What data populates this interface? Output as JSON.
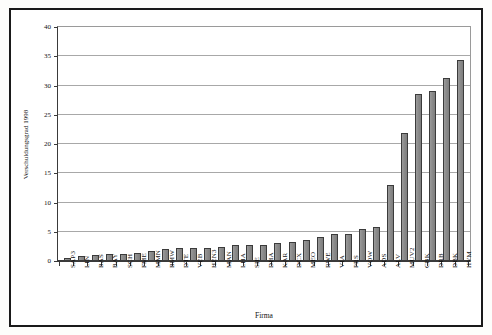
{
  "chart_data": {
    "type": "bar",
    "title": "",
    "xlabel": "Firma",
    "ylabel": "Verschuldungsgrad 1998",
    "ylim": [
      0,
      40
    ],
    "ytick_step": 5,
    "yticks": [
      0,
      5,
      10,
      15,
      20,
      25,
      30,
      35,
      40
    ],
    "grid": true,
    "legend": false,
    "bar_color": "#8a8a8a",
    "bar_border_color": "#3b3b3b",
    "categories": [
      "SAP3",
      "LIN",
      "BAS",
      "BAY",
      "SCH",
      "FME",
      "MMN",
      "BMW",
      "DTE",
      "VEB",
      "HEN3",
      "MAN",
      "LHA",
      "SIE",
      "DHA",
      "KAR",
      "DCX",
      "MEO",
      "RWE",
      "VIA",
      "PRS",
      "VOW",
      "ADS",
      "ALV",
      "MUV2",
      "CBK",
      "DRB",
      "DBK",
      "HVM"
    ],
    "values": [
      0.6,
      0.9,
      1.0,
      1.2,
      1.2,
      1.4,
      1.7,
      2.0,
      2.2,
      2.2,
      2.3,
      2.4,
      2.7,
      2.8,
      2.8,
      3.1,
      3.3,
      3.6,
      4.1,
      4.6,
      4.7,
      5.4,
      5.9,
      13.0,
      21.8,
      28.5,
      29.0,
      31.3,
      34.4
    ]
  }
}
